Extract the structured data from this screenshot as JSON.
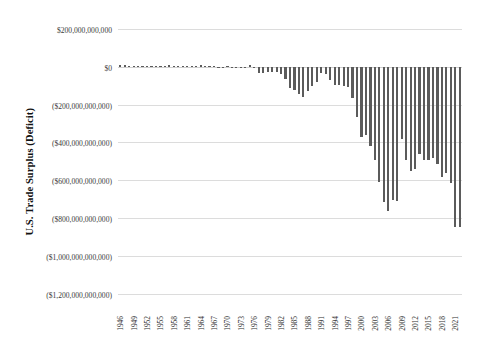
{
  "chart_data": {
    "type": "bar",
    "title": "",
    "xlabel": "",
    "ylabel": "U.S. Trade Surplus (Deficit)",
    "ylim": [
      -1300000000000,
      220000000000
    ],
    "ytick_values": [
      200000000000,
      0,
      -200000000000,
      -400000000000,
      -600000000000,
      -800000000000,
      -1000000000000,
      -1200000000000
    ],
    "ytick_labels": [
      "$200,000,000,000",
      "$0",
      "($200,000,000,000)",
      "($400,000,000,000)",
      "($600,000,000,000)",
      "($800,000,000,000)",
      "($1,000,000,000,000)",
      "($1,200,000,000,000)"
    ],
    "xtick_labels": [
      "1946",
      "1949",
      "1952",
      "1955",
      "1958",
      "1961",
      "1964",
      "1967",
      "1970",
      "1973",
      "1976",
      "1979",
      "1982",
      "1985",
      "1988",
      "1991",
      "1994",
      "1997",
      "2000",
      "2003",
      "2006",
      "2009",
      "2012",
      "2015",
      "2018",
      "2021"
    ],
    "grid": true,
    "legend": false,
    "bar_color": "#5b5b5b",
    "grid_color": "#dcdcdc",
    "categories": [
      "1946",
      "1947",
      "1948",
      "1949",
      "1950",
      "1951",
      "1952",
      "1953",
      "1954",
      "1955",
      "1956",
      "1957",
      "1958",
      "1959",
      "1960",
      "1961",
      "1962",
      "1963",
      "1964",
      "1965",
      "1966",
      "1967",
      "1968",
      "1969",
      "1970",
      "1971",
      "1972",
      "1973",
      "1974",
      "1975",
      "1976",
      "1977",
      "1978",
      "1979",
      "1980",
      "1981",
      "1982",
      "1983",
      "1984",
      "1985",
      "1986",
      "1987",
      "1988",
      "1989",
      "1990",
      "1991",
      "1992",
      "1993",
      "1994",
      "1995",
      "1996",
      "1997",
      "1998",
      "1999",
      "2000",
      "2001",
      "2002",
      "2003",
      "2004",
      "2005",
      "2006",
      "2007",
      "2008",
      "2009",
      "2010",
      "2011",
      "2012",
      "2013",
      "2014",
      "2015",
      "2016",
      "2017",
      "2018",
      "2019",
      "2020",
      "2021",
      "2022"
    ],
    "values": [
      6700000000,
      10900000000,
      5500000000,
      5400000000,
      1100000000,
      3100000000,
      2600000000,
      1400000000,
      2600000000,
      2900000000,
      4800000000,
      6300000000,
      3500000000,
      1100000000,
      4900000000,
      5600000000,
      4500000000,
      5200000000,
      6800000000,
      5000000000,
      3800000000,
      3800000000,
      600000000,
      600000000,
      2600000000,
      -2300000000,
      -6400000000,
      900000000,
      -5500000000,
      8900000000,
      -9500000000,
      -31100000000,
      -33900000000,
      -27500000000,
      -25500000000,
      -28000000000,
      -36500000000,
      -67100000000,
      -112500000000,
      -122200000000,
      -145100000000,
      -159600000000,
      -127000000000,
      -101700000000,
      -81500000000,
      -31100000000,
      -39200000000,
      -70300000000,
      -98500000000,
      -96400000000,
      -104100000000,
      -108300000000,
      -166100000000,
      -263200000000,
      -372500000000,
      -361500000000,
      -418000000000,
      -493900000000,
      -609900000000,
      -714200000000,
      -761700000000,
      -705400000000,
      -708700000000,
      -383800000000,
      -494700000000,
      -548600000000,
      -537600000000,
      -461900000000,
      -490200000000,
      -490200000000,
      -481200000000,
      -513900000000,
      -579900000000,
      -558700000000,
      -616100000000,
      -845000000000,
      -848000000000
    ]
  }
}
